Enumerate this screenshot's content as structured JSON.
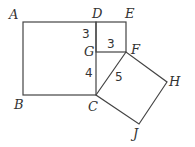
{
  "diagram": {
    "points": {
      "A": "A",
      "B": "B",
      "C": "C",
      "D": "D",
      "E": "E",
      "F": "F",
      "G": "G",
      "H": "H",
      "J": "J"
    },
    "lengths": {
      "DG": "3",
      "GF": "3",
      "GC": "4",
      "CF": "5"
    }
  }
}
